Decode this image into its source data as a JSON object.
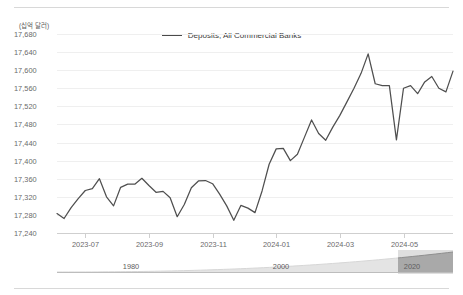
{
  "legend": {
    "items": [
      {
        "label": "Deposits, All Commercial Banks",
        "color": "#4f4f4f"
      }
    ]
  },
  "axis": {
    "y_unit_label": "(십억 달러)",
    "y_ticks": [
      "17,680",
      "17,640",
      "17,600",
      "17,560",
      "17,520",
      "17,480",
      "17,440",
      "17,400",
      "17,360",
      "17,320",
      "17,280",
      "17,240"
    ],
    "x_ticks": [
      "2023-07",
      "2023-09",
      "2023-11",
      "2024-01",
      "2024-03",
      "2024-05"
    ]
  },
  "navigator": {
    "year_labels": [
      "1980",
      "2000",
      "2020"
    ],
    "selection_color": "#b8b8b8",
    "area_color": "#9d9d9d"
  },
  "chart_data": {
    "type": "line",
    "title": "",
    "subtitle": "",
    "xlabel": "",
    "ylabel": "(십억 달러)",
    "ylim": [
      17240,
      17680
    ],
    "ytick_step": 40,
    "grid": true,
    "legend_position": "top-center",
    "x_tick_labels": [
      "2023-07",
      "2023-09",
      "2023-11",
      "2024-01",
      "2024-03",
      "2024-05"
    ],
    "x_tick_index": [
      4,
      13,
      22,
      31,
      40,
      49
    ],
    "series": [
      {
        "name": "Deposits, All Commercial Banks",
        "color": "#4f4f4f",
        "values": [
          17283,
          17272,
          17296,
          17316,
          17334,
          17338,
          17360,
          17320,
          17300,
          17341,
          17348,
          17348,
          17361,
          17345,
          17330,
          17332,
          17318,
          17276,
          17303,
          17340,
          17355,
          17356,
          17349,
          17326,
          17300,
          17268,
          17301,
          17295,
          17285,
          17333,
          17392,
          17426,
          17427,
          17400,
          17414,
          17452,
          17490,
          17460,
          17445,
          17474,
          17500,
          17530,
          17560,
          17593,
          17636,
          17570,
          17566,
          17566,
          17446,
          17560,
          17566,
          17548,
          17574,
          17586,
          17560,
          17552,
          17598
        ]
      }
    ]
  }
}
